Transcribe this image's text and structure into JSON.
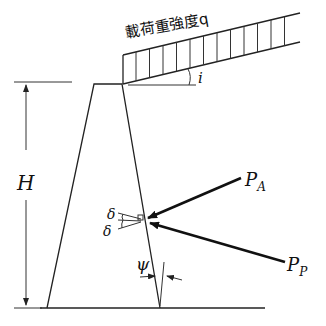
{
  "figure": {
    "load_label": "載荷重強度q",
    "labels": {
      "height": "H",
      "slope_angle": "i",
      "active_force": "P",
      "active_sub": "A",
      "passive_force": "P",
      "passive_sub": "P",
      "friction_angle_upper": "δ",
      "friction_angle_lower": "δ",
      "wall_angle": "ψ"
    }
  }
}
